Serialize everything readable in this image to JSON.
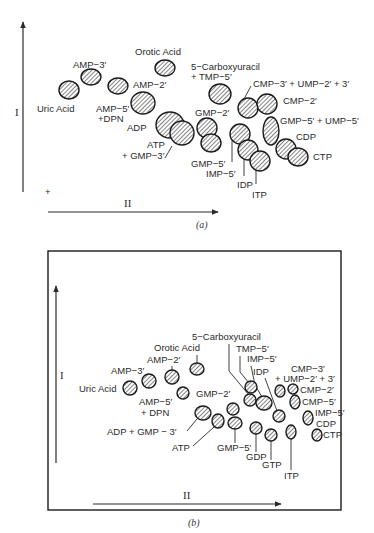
{
  "figure_a": {
    "caption": "(a)",
    "axis_y_label": "I",
    "axis_x_label": "II",
    "origin_marker": "+",
    "spots": [
      {
        "id": "uric-acid",
        "cx": 69,
        "cy": 90,
        "rx": 10,
        "ry": 9
      },
      {
        "id": "amp-3",
        "cx": 91,
        "cy": 77,
        "rx": 10,
        "ry": 8
      },
      {
        "id": "amp-5-dpn",
        "cx": 118,
        "cy": 86,
        "rx": 10,
        "ry": 8
      },
      {
        "id": "orotic-acid",
        "cx": 165,
        "cy": 68,
        "rx": 10,
        "ry": 8
      },
      {
        "id": "amp-2",
        "cx": 143,
        "cy": 103,
        "rx": 12,
        "ry": 11
      },
      {
        "id": "adp",
        "cx": 170,
        "cy": 125,
        "rx": 14,
        "ry": 13
      },
      {
        "id": "atp-gmp-3",
        "cx": 182,
        "cy": 133,
        "rx": 12,
        "ry": 12
      },
      {
        "id": "carboxyuracil-tmp-5",
        "cx": 220,
        "cy": 94,
        "rx": 11,
        "ry": 10
      },
      {
        "id": "gmp-2",
        "cx": 207,
        "cy": 128,
        "rx": 10,
        "ry": 10
      },
      {
        "id": "gmp-5",
        "cx": 211,
        "cy": 143,
        "rx": 10,
        "ry": 9
      },
      {
        "id": "imp-5",
        "cx": 240,
        "cy": 134,
        "rx": 10,
        "ry": 10
      },
      {
        "id": "idp",
        "cx": 248,
        "cy": 150,
        "rx": 10,
        "ry": 10
      },
      {
        "id": "itp",
        "cx": 260,
        "cy": 161,
        "rx": 10,
        "ry": 10
      },
      {
        "id": "cmp-3-ump-2-3",
        "cx": 248,
        "cy": 108,
        "rx": 10,
        "ry": 10
      },
      {
        "id": "cmp-2",
        "cx": 267,
        "cy": 104,
        "rx": 10,
        "ry": 10
      },
      {
        "id": "gmp-5-ump-5",
        "cx": 271,
        "cy": 131,
        "rx": 8,
        "ry": 14
      },
      {
        "id": "cdp",
        "cx": 286,
        "cy": 149,
        "rx": 10,
        "ry": 10
      },
      {
        "id": "ctp",
        "cx": 298,
        "cy": 157,
        "rx": 10,
        "ry": 9
      }
    ],
    "labels": [
      {
        "text": "Uric Acid",
        "x": 37,
        "y": 112
      },
      {
        "text": "AMP−3′",
        "x": 73,
        "y": 68
      },
      {
        "text": "AMP−5′",
        "x": 96,
        "y": 112
      },
      {
        "text": "+DPN",
        "x": 98,
        "y": 122
      },
      {
        "text": "Orotic Acid",
        "x": 135,
        "y": 55
      },
      {
        "text": "AMP−2′",
        "x": 133,
        "y": 88
      },
      {
        "text": "ADP",
        "x": 127,
        "y": 131
      },
      {
        "text": "ATP",
        "x": 147,
        "y": 148
      },
      {
        "text": "+ GMP−3′",
        "x": 122,
        "y": 159
      },
      {
        "text": "5−Carboxyuracil",
        "x": 191,
        "y": 70
      },
      {
        "text": "+ TMP−5′",
        "x": 191,
        "y": 80
      },
      {
        "text": "GMP−2′",
        "x": 195,
        "y": 116
      },
      {
        "text": "GMP−5′",
        "x": 191,
        "y": 167
      },
      {
        "text": "IMP−5′",
        "x": 206,
        "y": 177
      },
      {
        "text": "IDP",
        "x": 237,
        "y": 188
      },
      {
        "text": "ITP",
        "x": 252,
        "y": 198
      },
      {
        "text": "CMP−3′ + UMP−2′ + 3′",
        "x": 253,
        "y": 87
      },
      {
        "text": "CMP−2′",
        "x": 283,
        "y": 104
      },
      {
        "text": "GMP−5′ + UMP−5′",
        "x": 280,
        "y": 124
      },
      {
        "text": "CDP",
        "x": 296,
        "y": 140
      },
      {
        "text": "CTP",
        "x": 313,
        "y": 160
      }
    ]
  },
  "figure_b": {
    "caption": "(b)",
    "axis_y_label": "I",
    "axis_x_label": "II",
    "spots": [
      {
        "id": "uric-acid",
        "cx": 130,
        "cy": 388,
        "rx": 7,
        "ry": 7
      },
      {
        "id": "amp-3",
        "cx": 149,
        "cy": 381,
        "rx": 7,
        "ry": 7
      },
      {
        "id": "amp-2",
        "cx": 172,
        "cy": 377,
        "rx": 7,
        "ry": 7
      },
      {
        "id": "orotic-acid",
        "cx": 197,
        "cy": 369,
        "rx": 7,
        "ry": 6
      },
      {
        "id": "amp-5-dpn",
        "cx": 183,
        "cy": 393,
        "rx": 6,
        "ry": 6
      },
      {
        "id": "adp-gmp-3",
        "cx": 203,
        "cy": 413,
        "rx": 8,
        "ry": 7
      },
      {
        "id": "atp",
        "cx": 218,
        "cy": 421,
        "rx": 6,
        "ry": 7
      },
      {
        "id": "gmp-2-a",
        "cx": 233,
        "cy": 409,
        "rx": 6,
        "ry": 6
      },
      {
        "id": "gmp-5",
        "cx": 235,
        "cy": 423,
        "rx": 7,
        "ry": 6
      },
      {
        "id": "carboxyuracil",
        "cx": 250,
        "cy": 400,
        "rx": 6,
        "ry": 6
      },
      {
        "id": "tmp-5",
        "cx": 251,
        "cy": 387,
        "rx": 6,
        "ry": 6
      },
      {
        "id": "imp-5-mid",
        "cx": 264,
        "cy": 403,
        "rx": 8,
        "ry": 7
      },
      {
        "id": "idp",
        "cx": 279,
        "cy": 416,
        "rx": 6,
        "ry": 6
      },
      {
        "id": "gdp",
        "cx": 256,
        "cy": 428,
        "rx": 6,
        "ry": 6
      },
      {
        "id": "gtp",
        "cx": 271,
        "cy": 435,
        "rx": 6,
        "ry": 6
      },
      {
        "id": "itp",
        "cx": 291,
        "cy": 432,
        "rx": 5,
        "ry": 7
      },
      {
        "id": "cmp-3-ump",
        "cx": 280,
        "cy": 391,
        "rx": 5,
        "ry": 6
      },
      {
        "id": "cmp-2",
        "cx": 293,
        "cy": 389,
        "rx": 5,
        "ry": 5
      },
      {
        "id": "cmp-5",
        "cx": 295,
        "cy": 402,
        "rx": 5,
        "ry": 7
      },
      {
        "id": "imp-5-cdp",
        "cx": 308,
        "cy": 418,
        "rx": 5,
        "ry": 7
      },
      {
        "id": "ctp",
        "cx": 317,
        "cy": 435,
        "rx": 5,
        "ry": 6
      }
    ],
    "labels": [
      {
        "text": "5−Carboxyuracil",
        "x": 192,
        "y": 340
      },
      {
        "text": "TMP−5′",
        "x": 236,
        "y": 352
      },
      {
        "text": "Orotic  Acid",
        "x": 154,
        "y": 351
      },
      {
        "text": "IMP−5′",
        "x": 247,
        "y": 362
      },
      {
        "text": "AMP−2′",
        "x": 147,
        "y": 363
      },
      {
        "text": "CMP−3′",
        "x": 291,
        "y": 372
      },
      {
        "text": "AMP−3′",
        "x": 111,
        "y": 374
      },
      {
        "text": "IDP",
        "x": 253,
        "y": 375
      },
      {
        "text": "+ UMP−2′ + 3′",
        "x": 275,
        "y": 382
      },
      {
        "text": "Uric  Acid",
        "x": 79,
        "y": 392
      },
      {
        "text": "CMP−2′",
        "x": 300,
        "y": 393
      },
      {
        "text": "GMP−2′",
        "x": 196,
        "y": 397
      },
      {
        "text": "AMP−5′",
        "x": 139,
        "y": 405
      },
      {
        "text": "CMP−5′",
        "x": 302,
        "y": 405
      },
      {
        "text": "+ DPN",
        "x": 141,
        "y": 416
      },
      {
        "text": "IMP−5′",
        "x": 315,
        "y": 416
      },
      {
        "text": "CDP",
        "x": 316,
        "y": 427
      },
      {
        "text": "ADP + GMP − 3′",
        "x": 107,
        "y": 435
      },
      {
        "text": "CTP",
        "x": 323,
        "y": 438
      },
      {
        "text": "ATP",
        "x": 172,
        "y": 451
      },
      {
        "text": "GMP−5′",
        "x": 217,
        "y": 451
      },
      {
        "text": "GDP",
        "x": 246,
        "y": 460
      },
      {
        "text": "GTP",
        "x": 262,
        "y": 468
      },
      {
        "text": "ITP",
        "x": 284,
        "y": 479
      }
    ]
  }
}
